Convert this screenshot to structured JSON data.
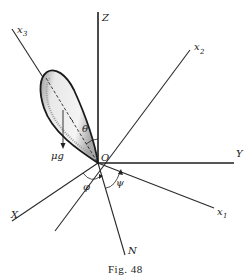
{
  "figure": {
    "caption": "Fig. 48",
    "caption_prefix": "Fig.",
    "caption_number": "48"
  },
  "axes": {
    "Z": "Z",
    "Y": "Y",
    "X": "X",
    "N": "N",
    "x1": "x",
    "x1_sub": "1",
    "x2": "x",
    "x2_sub": "2",
    "x3": "x",
    "x3_sub": "3"
  },
  "labels": {
    "origin": "O",
    "theta": "θ",
    "phi": "φ",
    "psi": "ψ",
    "weight": "μg"
  },
  "colors": {
    "ink": "#222222",
    "lobe_shading": "#b8b8b8",
    "background": "#ffffff"
  }
}
